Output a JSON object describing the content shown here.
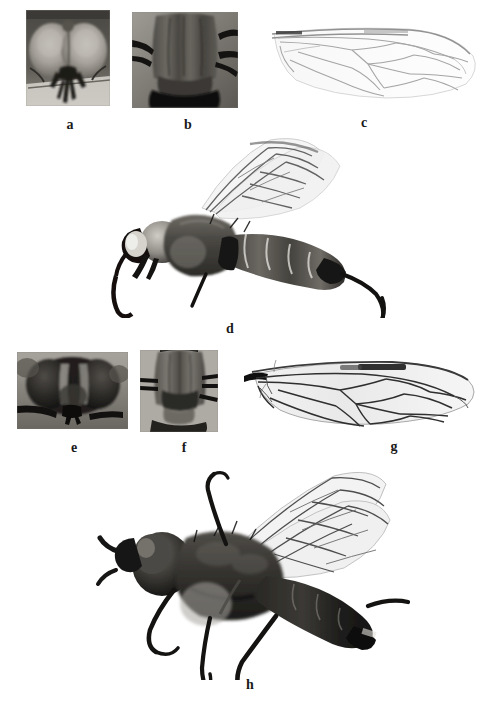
{
  "figure": {
    "background_color": "#ffffff",
    "width": 492,
    "height": 722,
    "label_color": "#1a1a1a",
    "panel_count": 8
  },
  "panels": [
    {
      "id": "a",
      "label": "a",
      "subject": "head-frontal-view",
      "description": "Frontal view of fly head showing large compound eyes meeting dorsally and dark mouthparts",
      "image_kind": "grayscale-photograph",
      "x": 26,
      "y": 10,
      "w": 84,
      "h": 96,
      "label_x": 58,
      "label_y": 118
    },
    {
      "id": "b",
      "label": "b",
      "subject": "thorax-dorsal-view",
      "description": "Dorsal view of thorax with longitudinal stripes and legs extending laterally",
      "image_kind": "grayscale-photograph",
      "x": 132,
      "y": 12,
      "w": 106,
      "h": 96,
      "label_x": 176,
      "label_y": 118
    },
    {
      "id": "c",
      "label": "c",
      "subject": "wing-venation-pale",
      "description": "Pale hyaline wing showing faint venation, outline of costal margin and discal cell",
      "image_kind": "grayscale-photograph",
      "x": 268,
      "y": 12,
      "w": 216,
      "h": 96,
      "label_x": 352,
      "label_y": 116
    },
    {
      "id": "d",
      "label": "d",
      "subject": "habitus-lateral-male",
      "description": "Lateral habitus of whole specimen with wings raised, banded abdomen and long legs",
      "image_kind": "grayscale-photograph",
      "x": 110,
      "y": 132,
      "w": 290,
      "h": 186,
      "label_x": 218,
      "label_y": 322
    },
    {
      "id": "e",
      "label": "e",
      "subject": "head-frontal-view-dark",
      "description": "Frontal view of dark fly head with broadly separated compound eyes and pale frontal stripes",
      "image_kind": "grayscale-photograph",
      "x": 17,
      "y": 352,
      "w": 111,
      "h": 77,
      "label_x": 62,
      "label_y": 441
    },
    {
      "id": "f",
      "label": "f",
      "subject": "thorax-dorsal-view-dark",
      "description": "Dorsal view of darker thorax and scutellum with lateral leg bases",
      "image_kind": "grayscale-photograph",
      "x": 140,
      "y": 350,
      "w": 78,
      "h": 82,
      "label_x": 172,
      "label_y": 441
    },
    {
      "id": "g",
      "label": "g",
      "subject": "wing-venation-dark-stigma",
      "description": "Wing with distinct dark pterostigma along the costal margin and strong dark venation",
      "image_kind": "grayscale-photograph",
      "x": 240,
      "y": 352,
      "w": 242,
      "h": 84,
      "label_x": 382,
      "label_y": 440
    },
    {
      "id": "h",
      "label": "h",
      "subject": "habitus-lateral-female",
      "description": "Lateral habitus of dark specimen with outstretched wings, elongate legs and tapered abdomen",
      "image_kind": "grayscale-photograph",
      "x": 90,
      "y": 458,
      "w": 320,
      "h": 222,
      "label_x": 238,
      "label_y": 678
    }
  ]
}
